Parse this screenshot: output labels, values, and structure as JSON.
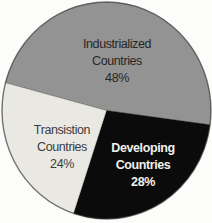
{
  "figure": {
    "background_color": "#fcfcfa",
    "rim_color": "rgba(50,50,50,0.55)",
    "slice_edge_color": "rgba(40,40,40,0.35)"
  },
  "chart_data": {
    "type": "pie",
    "title": "",
    "legend": "none",
    "categories": [
      "Industrialized Countries",
      "Developing Countries",
      "Transistion Countries"
    ],
    "values": [
      48,
      28,
      24
    ],
    "geometry": {
      "cx": 106.5,
      "cy": 110.5,
      "rx": 104.5,
      "ry": 108.5,
      "start_angle_deg": -75.2,
      "clockwise": true
    },
    "slices": [
      {
        "name": "industrialized-countries",
        "line1": "Industrialized",
        "line2": "Countries",
        "pct": "48%",
        "value": 48,
        "color": "#939393",
        "text_color": "#262626",
        "bold": false,
        "label_x": 117,
        "label_y": 61
      },
      {
        "name": "developing-countries",
        "line1": "Developing",
        "line2": "Countries",
        "pct": "28%",
        "value": 28,
        "color": "#0b0b0b",
        "text_color": "#f1f1ec",
        "bold": true,
        "label_x": 143,
        "label_y": 165
      },
      {
        "name": "transistion-countries",
        "line1": "Transistion",
        "line2": "Countries",
        "pct": "24%",
        "value": 24,
        "color": "#e9e8e2",
        "text_color": "#3c3c3c",
        "bold": false,
        "label_x": 62,
        "label_y": 147
      }
    ]
  }
}
